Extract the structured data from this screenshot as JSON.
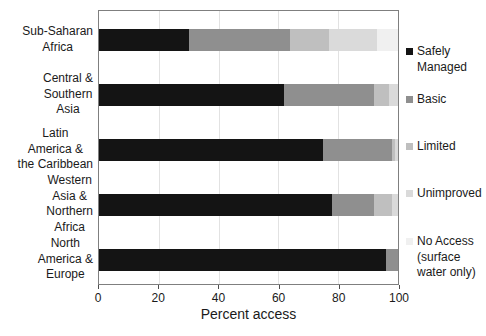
{
  "figure": {
    "background": "#ffffff",
    "plot_border_color": "#7f7f7f",
    "gridline_color": "#e2e2e2"
  },
  "chart_data": {
    "type": "bar",
    "orientation": "horizontal",
    "stacked": true,
    "title": "",
    "xlabel": "Percent access",
    "ylabel": "",
    "xlim": [
      0,
      100
    ],
    "x_ticks": [
      0,
      20,
      40,
      60,
      80,
      100
    ],
    "grid": "vertical",
    "legend_position": "right",
    "categories": [
      "Sub-Saharan Africa",
      "Central & Southern Asia",
      "Latin America & the Caribbean",
      "Western Asia & Northern Africa",
      "North America & Europe"
    ],
    "category_label_lines": [
      "Sub-Saharan\nAfrica",
      "Central &\nSouthern\nAsia",
      "Latin\nAmerica &\nthe Caribbean",
      "Western\nAsia &\nNorthern\nAfrica",
      "North\nAmerica &\nEurope"
    ],
    "series": [
      {
        "name": "Safely Managed",
        "color": "#141414",
        "values": [
          30,
          62,
          75,
          78,
          96
        ]
      },
      {
        "name": "Basic",
        "color": "#8f8f8f",
        "values": [
          34,
          30,
          23,
          14,
          4
        ]
      },
      {
        "name": "Limited",
        "color": "#bfbfbf",
        "values": [
          13,
          5,
          1,
          6,
          0
        ]
      },
      {
        "name": "Unimproved",
        "color": "#dadada",
        "values": [
          16,
          3,
          1,
          2,
          0
        ]
      },
      {
        "name": "No Access (surface water only)",
        "color": "#f0f0f0",
        "values": [
          7,
          0,
          0,
          0,
          0
        ]
      }
    ],
    "legend_entries": [
      {
        "label": "Safely\nManaged",
        "color": "#141414"
      },
      {
        "label": "Basic",
        "color": "#8f8f8f"
      },
      {
        "label": "Limited",
        "color": "#bfbfbf"
      },
      {
        "label": "Unimproved",
        "color": "#dadada"
      },
      {
        "label": "No Access\n(surface\nwater only)",
        "color": "#f0f0f0"
      }
    ]
  }
}
